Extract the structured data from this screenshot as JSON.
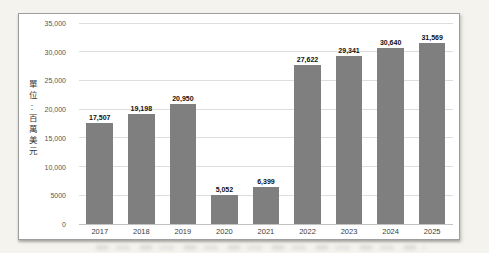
{
  "chart_data": {
    "type": "bar",
    "categories": [
      "2017",
      "2018",
      "2019",
      "2020",
      "2021",
      "2022",
      "2023",
      "2024",
      "2025"
    ],
    "values": [
      17507,
      19198,
      20950,
      5052,
      6399,
      27622,
      29341,
      30640,
      31569
    ],
    "value_labels": [
      "17,507",
      "19,198",
      "20,950",
      "5,052",
      "6,399",
      "27,622",
      "29,341",
      "30,640",
      "31,569"
    ],
    "xlabel": "",
    "ylabel": "單位:百萬美元",
    "ylim": [
      0,
      35000
    ],
    "y_ticks": [
      {
        "value": 0,
        "label": "0"
      },
      {
        "value": 5000,
        "label": "5000"
      },
      {
        "value": 10000,
        "label": "10,000"
      },
      {
        "value": 15000,
        "label": "15,000"
      },
      {
        "value": 20000,
        "label": "20,000"
      },
      {
        "value": 25000,
        "label": "25,000"
      },
      {
        "value": 30000,
        "label": "30,000"
      },
      {
        "value": 35000,
        "label": "35,000"
      }
    ],
    "bar_color": "#7f7f7f",
    "grid": true,
    "legend_position": "none"
  }
}
